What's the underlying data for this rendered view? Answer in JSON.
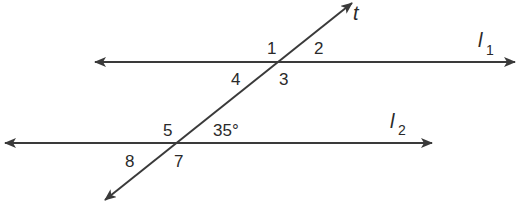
{
  "diagram": {
    "type": "parallel-lines-cut-by-transversal",
    "colors": {
      "line": "#3a3a3a",
      "text": "#2a2a2a",
      "background": "#ffffff"
    },
    "lines": {
      "l1": {
        "name": "l",
        "subscript": "1"
      },
      "l2": {
        "name": "l",
        "subscript": "2"
      },
      "t": {
        "name": "t"
      }
    },
    "angles": {
      "a1": "1",
      "a2": "2",
      "a3": "3",
      "a4": "4",
      "a5": "5",
      "a6": "35°",
      "a7": "7",
      "a8": "8"
    }
  }
}
